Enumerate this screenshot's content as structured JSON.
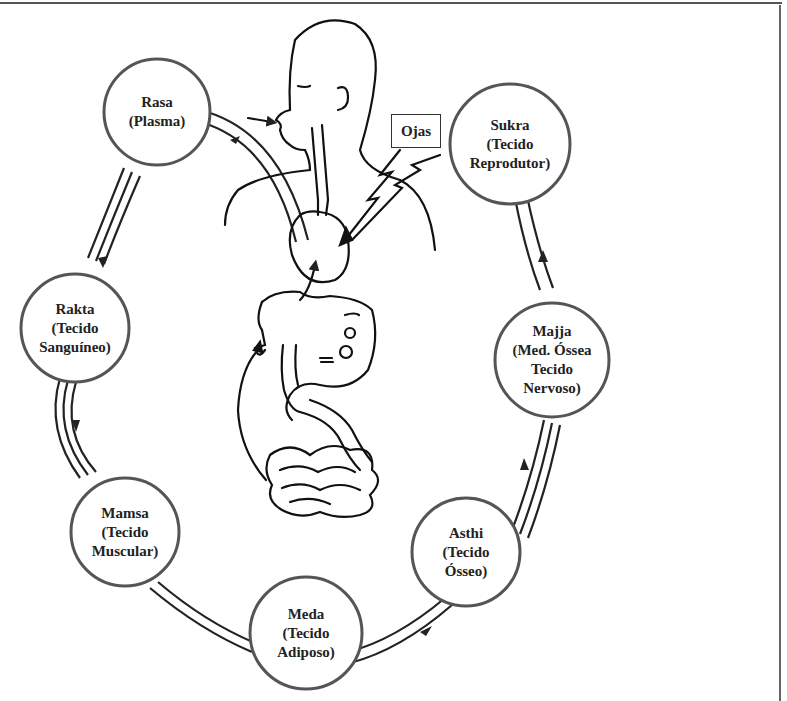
{
  "diagram": {
    "type": "cycle",
    "center_illustration": "human-digestive-system",
    "ojas_label": "Ojas",
    "nodes": [
      {
        "id": "rasa",
        "lines": [
          "Rasa",
          "(Plasma)"
        ]
      },
      {
        "id": "rakta",
        "lines": [
          "Rakta",
          "(Tecido",
          "Sanguíneo)"
        ]
      },
      {
        "id": "mamsa",
        "lines": [
          "Mamsa",
          "(Tecido",
          "Muscular)"
        ]
      },
      {
        "id": "meda",
        "lines": [
          "Meda",
          "(Tecido",
          "Adiposo)"
        ]
      },
      {
        "id": "asthi",
        "lines": [
          "Asthi",
          "(Tecido",
          "Ósseo)"
        ]
      },
      {
        "id": "majja",
        "lines": [
          "Majja",
          "(Med. Óssea",
          "Tecido",
          "Nervoso)"
        ]
      },
      {
        "id": "sukra",
        "lines": [
          "Sukra",
          "(Tecido",
          "Reprodutor)"
        ]
      }
    ],
    "flow_order": [
      "rasa",
      "rakta",
      "mamsa",
      "meda",
      "asthi",
      "majja",
      "sukra"
    ],
    "colors": {
      "stroke": "#222222",
      "circle_stroke": "#555555",
      "background": "#ffffff"
    }
  }
}
